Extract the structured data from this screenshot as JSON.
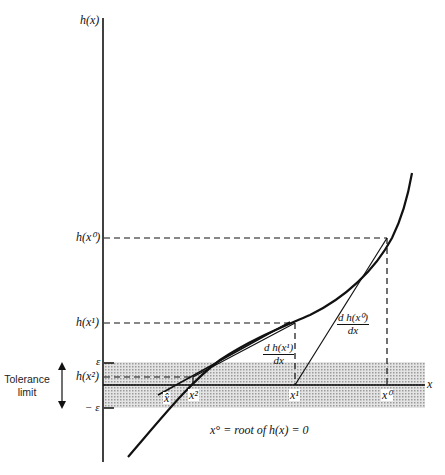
{
  "diagram": {
    "type": "newton-raphson-illustration",
    "axes": {
      "y_label": "h(x)",
      "x_label": "x"
    },
    "y_ticks": {
      "h_x0": "h(x⁰)",
      "h_x1": "h(x¹)",
      "h_x2": "h(x²)",
      "epsilon": "ε",
      "neg_epsilon": "− ε"
    },
    "x_ticks": {
      "x0": "x⁰",
      "x1": "x¹",
      "x2": "x²",
      "xhat": "x̂"
    },
    "tangent_labels": {
      "t0_num": "d h(x⁰)",
      "t0_den": "dx",
      "t1_num": "d h(x¹)",
      "t1_den": "dx"
    },
    "tolerance": {
      "line1": "Tolerance",
      "line2": "limit"
    },
    "caption": "x° = root of h(x) = 0",
    "colors": {
      "ink": "#111111",
      "band": "#cfcfcf"
    }
  }
}
